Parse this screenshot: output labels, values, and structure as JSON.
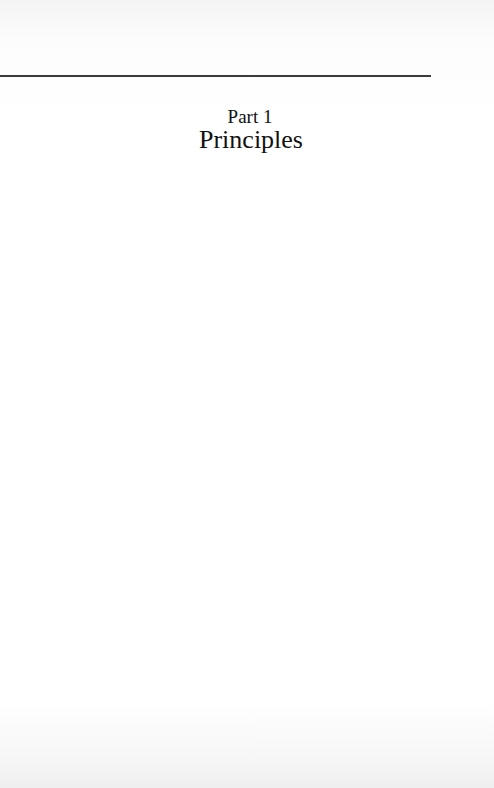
{
  "page": {
    "type": "part-title-page",
    "part_number": "Part 1",
    "part_title": "Principles"
  },
  "colors": {
    "background": "#ffffff",
    "text": "#111111",
    "rule": "#3a3a3a"
  }
}
